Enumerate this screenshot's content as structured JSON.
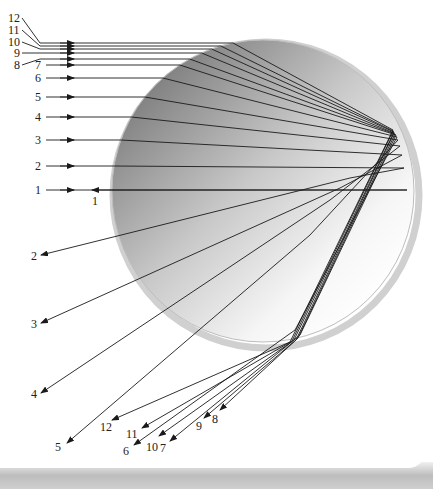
{
  "figure": {
    "incoming_labels": [
      "1",
      "2",
      "3",
      "4",
      "5",
      "6",
      "7",
      "8",
      "9",
      "10",
      "11",
      "12"
    ],
    "outgoing_labels": [
      "1",
      "2",
      "3",
      "4",
      "5",
      "6",
      "7",
      "8",
      "9",
      "10",
      "11",
      "12"
    ],
    "colors": {
      "sphere_light": "#ffffff",
      "sphere_dark": "#8a8a8a",
      "ray": "#1a1a1a",
      "rim": "#c8c8c8",
      "background": "#ffffff",
      "panel_shadow": "#bdbdbd"
    }
  },
  "rays_in": [
    {
      "label": "1",
      "y": 190,
      "label_x": 35,
      "label_y": 194
    },
    {
      "label": "2",
      "y": 166,
      "label_x": 35,
      "label_y": 170
    },
    {
      "label": "3",
      "y": 140,
      "label_x": 35,
      "label_y": 144
    },
    {
      "label": "4",
      "y": 117,
      "label_x": 35,
      "label_y": 121
    },
    {
      "label": "5",
      "y": 97,
      "label_x": 35,
      "label_y": 101
    },
    {
      "label": "6",
      "y": 78,
      "label_x": 35,
      "label_y": 82
    },
    {
      "label": "7",
      "y": 65,
      "label_x": 35,
      "label_y": 69
    },
    {
      "label": "8",
      "y": 59,
      "label_x": 14,
      "label_y": 69
    },
    {
      "label": "9",
      "y": 53,
      "label_x": 14,
      "label_y": 57
    },
    {
      "label": "10",
      "y": 49,
      "label_x": 8,
      "label_y": 46
    },
    {
      "label": "11",
      "y": 46,
      "label_x": 8,
      "label_y": 34
    },
    {
      "label": "12",
      "y": 43,
      "label_x": 8,
      "label_y": 22
    }
  ],
  "rays_out": [
    {
      "label": "1",
      "x": 92,
      "y": 190,
      "label_x": 92,
      "label_y": 205
    },
    {
      "label": "2",
      "x": 41,
      "y": 255,
      "label_x": 31,
      "label_y": 260
    },
    {
      "label": "3",
      "x": 41,
      "y": 323,
      "label_x": 31,
      "label_y": 328
    },
    {
      "label": "4",
      "x": 41,
      "y": 393,
      "label_x": 31,
      "label_y": 398
    },
    {
      "label": "5",
      "x": 67,
      "y": 443,
      "label_x": 55,
      "label_y": 451
    },
    {
      "label": "6",
      "x": 134,
      "y": 445,
      "label_x": 123,
      "label_y": 455
    },
    {
      "label": "7",
      "x": 170,
      "y": 441,
      "label_x": 160,
      "label_y": 452
    },
    {
      "label": "8",
      "x": 220,
      "y": 410,
      "label_x": 212,
      "label_y": 423
    },
    {
      "label": "9",
      "x": 204,
      "y": 418,
      "label_x": 196,
      "label_y": 430
    },
    {
      "label": "10",
      "x": 159,
      "y": 436,
      "label_x": 146,
      "label_y": 451
    },
    {
      "label": "11",
      "x": 142,
      "y": 428,
      "label_x": 126,
      "label_y": 438
    },
    {
      "label": "12",
      "x": 112,
      "y": 420,
      "label_x": 100,
      "label_y": 431
    }
  ]
}
